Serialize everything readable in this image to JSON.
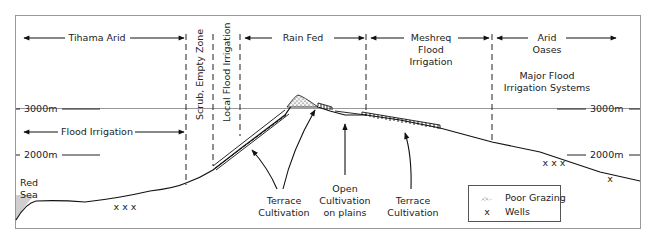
{
  "zones": {
    "tihama_arid": "Tihama Arid",
    "flood_irrigation": "Flood Irrigation",
    "scrub_empty": "Scrub, Empty Zone",
    "local_flood": "Local Flood Irrigation",
    "rain_fed": "Rain Fed",
    "meshreq_1": "Meshreq",
    "meshreq_2": "Flood",
    "meshreq_3": "Irrigation",
    "arid_1": "Arid",
    "arid_2": "Oases",
    "major_1": "Major Flood",
    "major_2": "Irrigation Systems"
  },
  "elevations": {
    "left_3000": "3000m",
    "left_2000": "2000m",
    "right_3000": "3000m",
    "right_2000": "2000m"
  },
  "places": {
    "red_sea_1": "Red",
    "red_sea_2": "Sea"
  },
  "annotations": {
    "terrace_left_1": "Terrace",
    "terrace_left_2": "Cultivation",
    "open_1": "Open",
    "open_2": "Cultivation",
    "open_3": "on plains",
    "terrace_right_1": "Terrace",
    "terrace_right_2": "Cultivation"
  },
  "wells": {
    "left": "x x x",
    "right": "x x x",
    "far_right": "x"
  },
  "legend": {
    "poor_grazing": "Poor Grazing",
    "wells": "Wells",
    "wells_symbol": "x"
  }
}
